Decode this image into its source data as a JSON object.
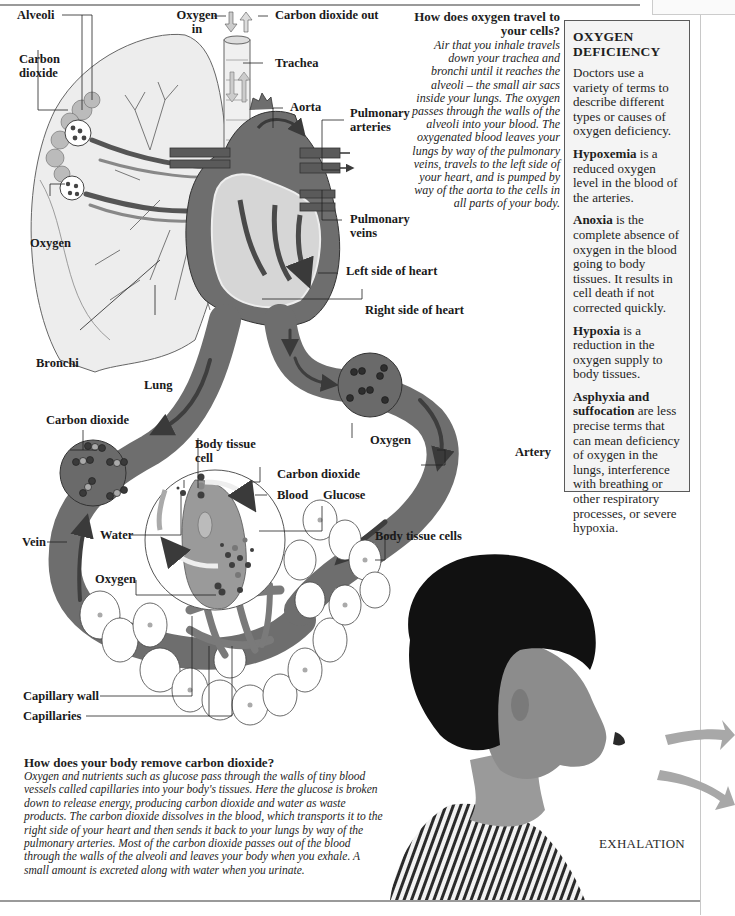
{
  "diagram_labels": {
    "alveoli": "Alveoli",
    "carbon_dioxide_lung": "Carbon dioxide",
    "oxygen_lung": "Oxygen",
    "oxygen_in": "Oxygen in",
    "carbon_dioxide_out": "Carbon dioxide out",
    "trachea": "Trachea",
    "aorta": "Aorta",
    "pulmonary_arteries": "Pulmonary arteries",
    "pulmonary_veins": "Pulmonary veins",
    "left_side_heart": "Left side of heart",
    "right_side_heart": "Right side of heart",
    "bronchi": "Bronchi",
    "lung": "Lung",
    "carbon_dioxide_vein": "Carbon dioxide",
    "oxygen_artery": "Oxygen",
    "artery": "Artery",
    "body_tissue_cell": "Body tissue cell",
    "carbon_dioxide_cell": "Carbon dioxide",
    "blood": "Blood",
    "glucose": "Glucose",
    "water": "Water",
    "vein": "Vein",
    "body_tissue_cells": "Body tissue cells",
    "oxygen_cell": "Oxygen",
    "capillary_wall": "Capillary wall",
    "capillaries": "Capillaries"
  },
  "oxygen_travel": {
    "heading": "How does oxygen travel to your cells?",
    "body": "Air that you inhale travels down your trachea and bronchi until it reaches the alveoli – the small air sacs inside your lungs. The oxygen passes through the walls of the alveoli into your blood. The oxygenated blood leaves your lungs by way of the pulmonary veins, travels to the left side of your heart, and is pumped by way of the aorta to the cells in all parts of your body."
  },
  "deficiency_box": {
    "title": "OXYGEN DEFICIENCY",
    "intro": "Doctors use a variety of terms to describe different types or causes of oxygen deficiency.",
    "terms": [
      {
        "term": "Hypoxemia",
        "definition": " is a reduced oxygen level in the blood of the arteries."
      },
      {
        "term": "Anoxia",
        "definition": " is the complete absence of oxygen in the blood going to body tissues. It results in cell death if not corrected quickly."
      },
      {
        "term": "Hypoxia",
        "definition": " is a reduction in the oxygen supply to body tissues."
      },
      {
        "term": "Asphyxia and suffocation",
        "definition": " are less precise terms that can mean deficiency of oxygen in the lungs, interference with breathing or other respiratory processes, or severe hypoxia."
      }
    ]
  },
  "co2_removal": {
    "heading": "How does your body remove carbon dioxide?",
    "body": "Oxygen and nutrients such as glucose pass through the walls of tiny blood vessels called capillaries into your body's tissues. Here the glucose is broken down to release energy, producing carbon dioxide and water as waste products. The carbon dioxide dissolves in the blood, which transports it to the right side of your heart and then sends it back to your lungs by way of the pulmonary arteries. Most of the carbon dioxide passes out of the blood through the walls of the alveoli and leaves your body when you exhale. A small amount is excreted along with water when you urinate."
  },
  "photo_caption": "EXHALATION",
  "colors": {
    "vessel": "#6e6e6e",
    "vessel_dark": "#4a4a4a",
    "vessel_light": "#9a9a9a",
    "lung_fill": "#ededed",
    "heart_inner": "#d6d6d6",
    "hair": "#111111",
    "skin": "#8c8c8c",
    "exhale_arrow": "#a8a8a8",
    "box_bg": "#f4f4f4"
  }
}
